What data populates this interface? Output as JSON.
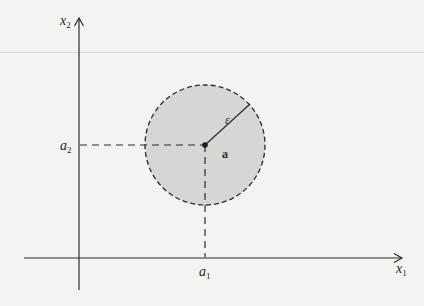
{
  "figure": {
    "type": "diagram",
    "axes": {
      "x_label": "x",
      "x_sub": "1",
      "y_label": "x",
      "y_sub": "2"
    },
    "point": {
      "label": "a",
      "coord_x_label": "a",
      "coord_x_sub": "1",
      "coord_y_label": "a",
      "coord_y_sub": "2"
    },
    "radius_label": "ε",
    "colors": {
      "ink": "#2a2a2a",
      "disk_fill": "#d6d6d4",
      "background": "#f3f3f1"
    }
  }
}
